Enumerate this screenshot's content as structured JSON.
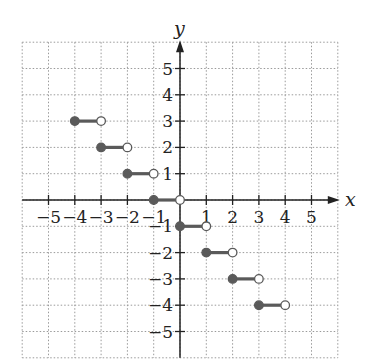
{
  "chart_data": {
    "type": "scatter",
    "subtype": "step-function",
    "title": "",
    "xlabel": "x",
    "ylabel": "y",
    "xlim": [
      -6,
      6
    ],
    "ylim": [
      -6,
      6
    ],
    "grid": true,
    "grid_style": "dotted",
    "x_ticks": [
      -5,
      -4,
      -3,
      -2,
      -1,
      1,
      2,
      3,
      4,
      5
    ],
    "y_ticks": [
      -5,
      -4,
      -3,
      -2,
      -1,
      1,
      2,
      3,
      4,
      5
    ],
    "x_tick_labels": [
      "−5",
      "−4",
      "−3",
      "−2",
      "−1",
      "1",
      "2",
      "3",
      "4",
      "5"
    ],
    "y_tick_labels": [
      "−5",
      "−4",
      "−3",
      "−2",
      "−1",
      "1",
      "2",
      "3",
      "4",
      "5"
    ],
    "segments": [
      {
        "x_start": -4,
        "x_end": -3,
        "y": 3,
        "start_closed": true,
        "end_closed": false
      },
      {
        "x_start": -3,
        "x_end": -2,
        "y": 2,
        "start_closed": true,
        "end_closed": false
      },
      {
        "x_start": -2,
        "x_end": -1,
        "y": 1,
        "start_closed": true,
        "end_closed": false
      },
      {
        "x_start": -1,
        "x_end": 0,
        "y": 0,
        "start_closed": true,
        "end_closed": false
      },
      {
        "x_start": 0,
        "x_end": 1,
        "y": -1,
        "start_closed": true,
        "end_closed": false
      },
      {
        "x_start": 1,
        "x_end": 2,
        "y": -2,
        "start_closed": true,
        "end_closed": false
      },
      {
        "x_start": 2,
        "x_end": 3,
        "y": -3,
        "start_closed": true,
        "end_closed": false
      },
      {
        "x_start": 3,
        "x_end": 4,
        "y": -4,
        "start_closed": true,
        "end_closed": false
      }
    ],
    "colors": {
      "segment": "#5a5a5a",
      "axis": "#222222",
      "grid": "#9a9a9a",
      "open_fill": "#ffffff"
    }
  }
}
